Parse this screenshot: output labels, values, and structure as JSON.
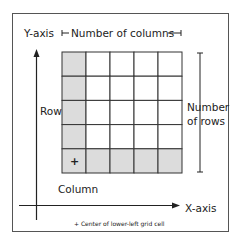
{
  "labels": {
    "y_axis": "Y-axis",
    "x_axis": "X-axis",
    "num_columns": "Number of columns",
    "num_rows_line1": "Number",
    "num_rows_line2": "of rows",
    "row": "Row",
    "column": "Column",
    "center_marker": "+",
    "footnote": "+ Center of lower-left grid cell"
  },
  "grid": {
    "rows": 5,
    "columns": 5,
    "highlighted": "first column and bottom row",
    "center_marker_cell": {
      "row": 1,
      "column": 1
    }
  },
  "colors": {
    "cell_highlight": "#dcdcdc",
    "cell_plain": "#ffffff",
    "line": "#333333",
    "frame": "#555555"
  }
}
